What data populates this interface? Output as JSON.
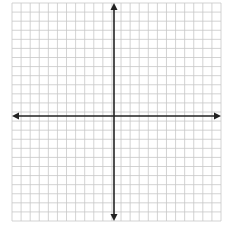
{
  "diagram": {
    "type": "coordinate-plane",
    "title": "",
    "grid": {
      "left": 12,
      "top": 3,
      "right": 221,
      "bottom": 221,
      "cols": 23,
      "rows": 24,
      "line_color": "#c8c8c8",
      "line_width": 0.8
    },
    "axes": {
      "x_axis_y": 116,
      "y_axis_x": 114,
      "color": "#222222",
      "width": 1.6,
      "x_start": 12,
      "x_end": 221,
      "y_start": 3,
      "y_end": 221,
      "arrows": [
        "left",
        "right",
        "up",
        "down"
      ]
    },
    "labels": []
  }
}
